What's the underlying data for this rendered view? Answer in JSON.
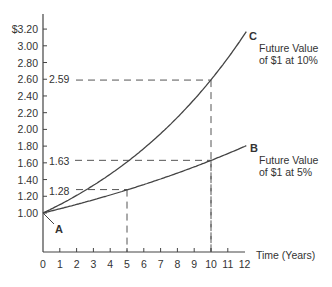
{
  "chart_data": {
    "type": "line",
    "title": "",
    "xlabel": "Time (Years)",
    "ylabel": "",
    "xlim": [
      0,
      12
    ],
    "ylim": [
      1.0,
      3.2
    ],
    "x_ticks": [
      "0",
      "1",
      "2",
      "3",
      "4",
      "5",
      "6",
      "7",
      "8",
      "9",
      "10",
      "11",
      "12"
    ],
    "y_ticks": [
      "$3.20",
      "3.00",
      "2.80",
      "2.60",
      "2.40",
      "2.20",
      "2.00",
      "1.80",
      "1.60",
      "1.40",
      "1.20",
      "1.00"
    ],
    "grid": false,
    "series": [
      {
        "name": "Future Value of $1 at 10%",
        "endpoint_label": "C",
        "rate": 0.1,
        "x": [
          0,
          1,
          2,
          3,
          4,
          5,
          6,
          7,
          8,
          9,
          10,
          11,
          12
        ],
        "values": [
          1.0,
          1.1,
          1.21,
          1.33,
          1.46,
          1.61,
          1.77,
          1.95,
          2.14,
          2.36,
          2.59,
          2.85,
          3.14
        ]
      },
      {
        "name": "Future Value of $1 at 5%",
        "endpoint_label": "B",
        "rate": 0.05,
        "x": [
          0,
          1,
          2,
          3,
          4,
          5,
          6,
          7,
          8,
          9,
          10,
          11,
          12
        ],
        "values": [
          1.0,
          1.05,
          1.1,
          1.16,
          1.22,
          1.28,
          1.34,
          1.41,
          1.48,
          1.55,
          1.63,
          1.71,
          1.8
        ]
      }
    ],
    "annotations": [
      {
        "label": "A",
        "x": 0,
        "y": 1.0
      },
      {
        "label": "2.59",
        "x": 10,
        "y": 2.59,
        "guide": "dashed"
      },
      {
        "label": "1.63",
        "x": 10,
        "y": 1.63,
        "guide": "dashed"
      },
      {
        "label": "1.28",
        "x": 5,
        "y": 1.28,
        "guide": "dashed"
      }
    ]
  },
  "labels": {
    "point_a": "A",
    "point_b": "B",
    "point_c": "C",
    "series_c_line1": "Future Value",
    "series_c_line2": "of $1 at 10%",
    "series_b_line1": "Future Value",
    "series_b_line2": "of $1 at 5%",
    "val_259": "2.59",
    "val_163": "1.63",
    "val_128": "1.28",
    "xlabel": "Time (Years)"
  }
}
